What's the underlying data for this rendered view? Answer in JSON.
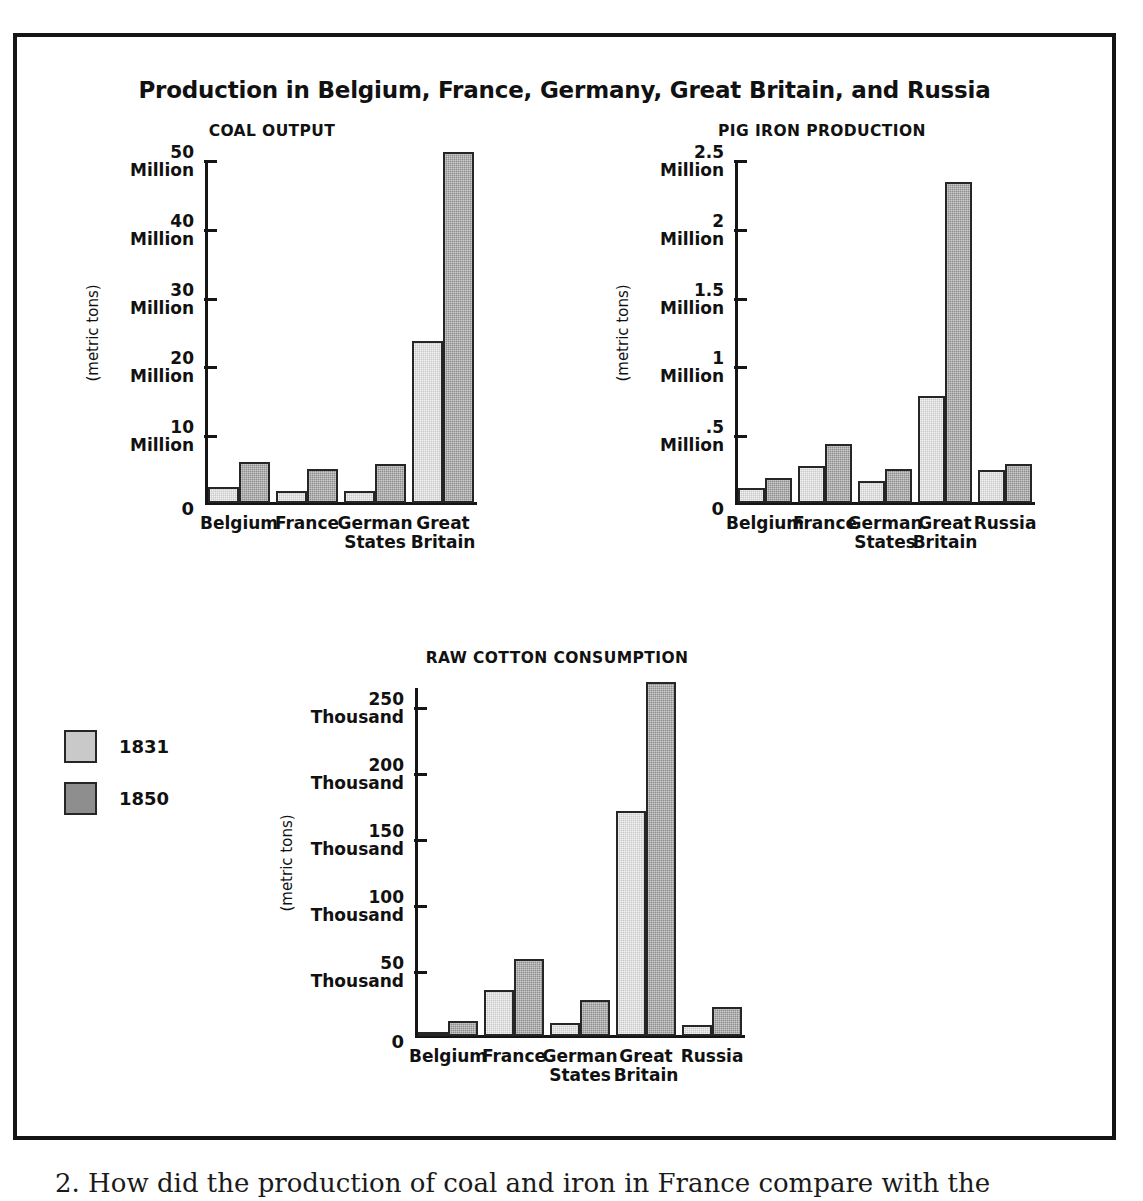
{
  "figure": {
    "title": "Production in Belgium, France, Germany, Great Britain, and Russia"
  },
  "legend": {
    "items": [
      {
        "label": "1831",
        "color": "#c9c9c9"
      },
      {
        "label": "1850",
        "color": "#8e8e8e"
      }
    ]
  },
  "caption": {
    "text": "2. How did the production of coal and iron in France compare with the"
  },
  "chart_data": [
    {
      "type": "bar",
      "title": "COAL OUTPUT",
      "xlabel": "",
      "ylabel": "(metric tons)",
      "ylim": [
        0,
        50
      ],
      "grid": false,
      "legend_position": "left",
      "tick_values": [
        0,
        10,
        20,
        30,
        40,
        50
      ],
      "tick_labels": [
        {
          "num": "0",
          "unit": ""
        },
        {
          "num": "10",
          "unit": "Million"
        },
        {
          "num": "20",
          "unit": "Million"
        },
        {
          "num": "30",
          "unit": "Million"
        },
        {
          "num": "40",
          "unit": "Million"
        },
        {
          "num": "50",
          "unit": "Million"
        }
      ],
      "categories": [
        "Belgium",
        "France",
        "German\nStates",
        "Great\nBritain"
      ],
      "series": [
        {
          "name": "1831",
          "values": [
            2.3,
            1.8,
            1.7,
            23.5
          ]
        },
        {
          "name": "1850",
          "values": [
            6.0,
            4.9,
            5.7,
            51.0
          ]
        }
      ]
    },
    {
      "type": "bar",
      "title": "PIG IRON PRODUCTION",
      "xlabel": "",
      "ylabel": "(metric tons)",
      "ylim": [
        0,
        2.5
      ],
      "grid": false,
      "legend_position": "left",
      "tick_values": [
        0,
        0.5,
        1,
        1.5,
        2,
        2.5
      ],
      "tick_labels": [
        {
          "num": "0",
          "unit": ""
        },
        {
          "num": ".5",
          "unit": "Million"
        },
        {
          "num": "1",
          "unit": "Million"
        },
        {
          "num": "1.5",
          "unit": "Million"
        },
        {
          "num": "2",
          "unit": "Million"
        },
        {
          "num": "2.5",
          "unit": "Million"
        }
      ],
      "categories": [
        "Belgium",
        "France",
        "German\nStates",
        "Great\nBritain",
        "Russia"
      ],
      "series": [
        {
          "name": "1831",
          "values": [
            0.11,
            0.27,
            0.16,
            0.78,
            0.24
          ]
        },
        {
          "name": "1850",
          "values": [
            0.18,
            0.43,
            0.25,
            2.33,
            0.28
          ]
        }
      ]
    },
    {
      "type": "bar",
      "title": "RAW COTTON CONSUMPTION",
      "xlabel": "",
      "ylabel": "(metric tons)",
      "ylim": [
        0,
        265
      ],
      "grid": false,
      "legend_position": "left",
      "tick_values": [
        0,
        50,
        100,
        150,
        200,
        250
      ],
      "tick_labels": [
        {
          "num": "0",
          "unit": ""
        },
        {
          "num": "50",
          "unit": "Thousand"
        },
        {
          "num": "100",
          "unit": "Thousand"
        },
        {
          "num": "150",
          "unit": "Thousand"
        },
        {
          "num": "200",
          "unit": "Thousand"
        },
        {
          "num": "250",
          "unit": "Thousand"
        }
      ],
      "categories": [
        "Belgium",
        "France",
        "German\nStates",
        "Great\nBritain",
        "Russia"
      ],
      "series": [
        {
          "name": "1831",
          "values": [
            3,
            35,
            10,
            170,
            8
          ]
        },
        {
          "name": "1850",
          "values": [
            11,
            58,
            27,
            268,
            22
          ]
        }
      ]
    }
  ]
}
